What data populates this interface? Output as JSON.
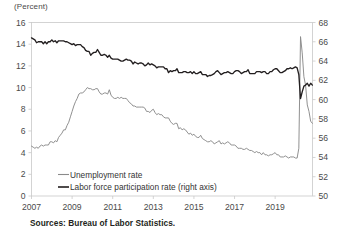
{
  "axis_unit_label": "(Percent)",
  "source_note": "Sources: Bureau of Labor Statistics.",
  "legend": {
    "items": [
      {
        "key": "unemployment",
        "label": "Unemployment rate",
        "color": "#8a8a8a"
      },
      {
        "key": "participation",
        "label": "Labor force participation rate (right axis)",
        "color": "#231f20"
      }
    ]
  },
  "colors": {
    "unemployment": "#8a8a8a",
    "participation": "#231f20",
    "axis": "#c9c9c9",
    "tick_text": "#4a4a4a",
    "note_text": "#231f20",
    "background": "#ffffff"
  },
  "chart_data": {
    "type": "line",
    "title": "",
    "subtitle": "",
    "xlabel": "",
    "ylabel": "(Percent)",
    "y2label": "",
    "grid": false,
    "legend_position": "inside-bottom-left",
    "xlim": [
      2007.0,
      2020.84
    ],
    "ylim": [
      0,
      16
    ],
    "y2lim": [
      50,
      68
    ],
    "yticks": [
      0,
      2,
      4,
      6,
      8,
      10,
      12,
      14,
      16
    ],
    "y2ticks": [
      50,
      52,
      54,
      56,
      58,
      60,
      62,
      64,
      66,
      68
    ],
    "xticks": [
      2007,
      2009,
      2011,
      2013,
      2015,
      2017,
      2019
    ],
    "xtick_labels": [
      "2007",
      "2009",
      "2011",
      "2013",
      "2015",
      "2017",
      "2019"
    ],
    "x_start": 2007.0,
    "x_step_months": 1,
    "series": [
      {
        "name": "Unemployment rate",
        "axis": "left",
        "units": "percent",
        "color": "#8a8a8a",
        "values": [
          4.6,
          4.5,
          4.4,
          4.5,
          4.4,
          4.6,
          4.7,
          4.6,
          4.7,
          4.7,
          4.7,
          5.0,
          5.0,
          4.9,
          5.1,
          5.0,
          5.4,
          5.6,
          5.8,
          6.1,
          6.1,
          6.5,
          6.8,
          7.3,
          7.8,
          8.3,
          8.7,
          9.0,
          9.4,
          9.5,
          9.5,
          9.6,
          9.8,
          10.0,
          9.9,
          9.9,
          9.8,
          9.8,
          9.9,
          9.9,
          9.6,
          9.4,
          9.4,
          9.5,
          9.5,
          9.4,
          9.8,
          9.3,
          9.1,
          9.0,
          9.0,
          9.1,
          9.0,
          9.1,
          9.0,
          9.0,
          9.0,
          8.8,
          8.6,
          8.5,
          8.3,
          8.3,
          8.2,
          8.2,
          8.2,
          8.2,
          8.2,
          8.1,
          7.8,
          7.8,
          7.7,
          7.9,
          8.0,
          7.7,
          7.5,
          7.6,
          7.5,
          7.5,
          7.3,
          7.2,
          7.2,
          7.2,
          6.9,
          6.7,
          6.6,
          6.7,
          6.7,
          6.2,
          6.3,
          6.1,
          6.2,
          6.1,
          5.9,
          5.7,
          5.8,
          5.6,
          5.7,
          5.5,
          5.4,
          5.4,
          5.6,
          5.3,
          5.2,
          5.1,
          5.0,
          5.0,
          5.1,
          5.0,
          4.8,
          4.9,
          5.0,
          5.1,
          4.8,
          4.9,
          4.8,
          4.9,
          5.0,
          4.9,
          4.7,
          4.7,
          4.7,
          4.6,
          4.4,
          4.4,
          4.4,
          4.3,
          4.3,
          4.4,
          4.3,
          4.2,
          4.2,
          4.1,
          4.0,
          4.1,
          4.0,
          4.0,
          3.8,
          4.0,
          3.8,
          3.8,
          3.7,
          3.8,
          3.8,
          3.9,
          4.0,
          3.8,
          3.8,
          3.6,
          3.6,
          3.6,
          3.7,
          3.6,
          3.5,
          3.6,
          3.6,
          3.6,
          3.5,
          3.5,
          4.4,
          14.7,
          13.2,
          11.0,
          10.2,
          8.4,
          7.8,
          6.9,
          6.7
        ]
      },
      {
        "name": "Labor force participation rate (right axis)",
        "axis": "right",
        "units": "percent",
        "color": "#231f20",
        "values": [
          66.4,
          66.3,
          66.2,
          65.9,
          66.0,
          66.0,
          66.0,
          65.8,
          66.0,
          65.8,
          66.0,
          66.0,
          66.2,
          66.0,
          66.1,
          65.9,
          66.1,
          66.1,
          66.1,
          66.1,
          66.0,
          66.0,
          65.9,
          65.8,
          65.7,
          65.8,
          65.6,
          65.7,
          65.7,
          65.7,
          65.5,
          65.4,
          65.1,
          65.0,
          65.0,
          64.6,
          64.8,
          64.9,
          64.9,
          65.2,
          64.9,
          64.6,
          64.6,
          64.7,
          64.6,
          64.4,
          64.6,
          64.3,
          64.2,
          64.2,
          64.2,
          64.2,
          64.1,
          64.0,
          64.0,
          64.1,
          64.2,
          64.1,
          64.1,
          64.0,
          63.7,
          63.9,
          63.8,
          63.7,
          63.8,
          63.8,
          63.7,
          63.5,
          63.6,
          63.8,
          63.6,
          63.7,
          63.6,
          63.5,
          63.3,
          63.4,
          63.4,
          63.4,
          63.4,
          63.2,
          63.2,
          62.8,
          63.0,
          62.9,
          63.0,
          63.0,
          63.2,
          62.8,
          62.8,
          62.8,
          62.9,
          62.9,
          62.8,
          62.8,
          62.9,
          62.7,
          62.9,
          62.7,
          62.7,
          62.8,
          62.9,
          62.6,
          62.6,
          62.6,
          62.4,
          62.5,
          62.5,
          62.6,
          62.7,
          62.9,
          63.0,
          62.8,
          62.6,
          62.7,
          62.8,
          62.8,
          62.9,
          62.8,
          62.7,
          62.7,
          62.9,
          63.0,
          63.0,
          62.9,
          62.7,
          62.8,
          62.9,
          62.9,
          63.1,
          62.7,
          62.7,
          62.7,
          62.7,
          62.9,
          62.9,
          62.9,
          62.8,
          62.9,
          62.9,
          62.7,
          62.7,
          62.9,
          62.9,
          63.1,
          63.2,
          63.2,
          63.0,
          62.8,
          62.8,
          62.9,
          63.0,
          63.2,
          63.2,
          63.3,
          63.2,
          63.3,
          63.4,
          63.3,
          62.6,
          60.1,
          60.8,
          61.4,
          61.5,
          61.7,
          61.4,
          61.7,
          61.5
        ]
      }
    ],
    "annotations": []
  }
}
